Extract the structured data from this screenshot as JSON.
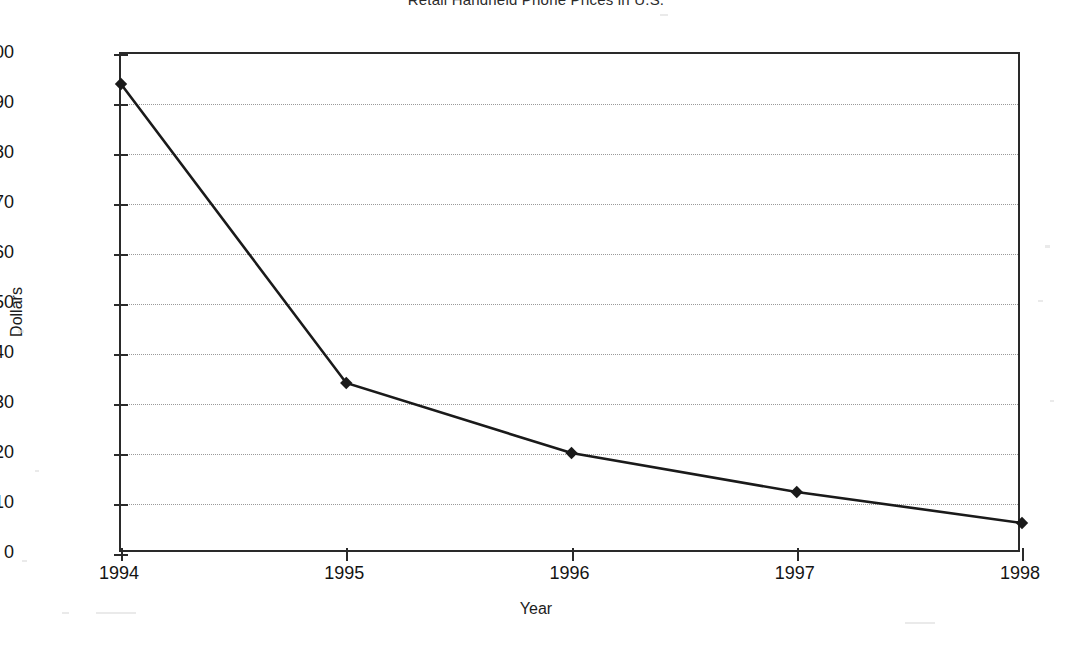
{
  "chart_data": {
    "type": "line",
    "title": "Retail Handheld Phone Prices in U.S.",
    "xlabel": "Year",
    "ylabel": "Dollars",
    "categories": [
      "1994",
      "1995",
      "1996",
      "1997",
      "1998"
    ],
    "values": [
      94,
      34.2,
      20.2,
      12.4,
      6.2
    ],
    "series": [
      {
        "name": "Retail handheld phone price",
        "values": [
          94,
          34.2,
          20.2,
          12.4,
          6.2
        ]
      }
    ],
    "xlim": [
      "1994",
      "1998"
    ],
    "ylim": [
      0,
      100
    ],
    "ytick_labels": [
      "100",
      "90",
      "80",
      "70",
      "60",
      "50",
      "40",
      "30",
      "20",
      "10",
      "0"
    ],
    "ytick_values": [
      100,
      90,
      80,
      70,
      60,
      50,
      40,
      30,
      20,
      10,
      0
    ],
    "xtick_labels": [
      "1994",
      "1995",
      "1996",
      "1997",
      "1998"
    ],
    "grid": true,
    "grid_style": "dotted",
    "grid_axis": "y",
    "legend": false,
    "legend_position": "none",
    "marker": "diamond",
    "line_color": "#1a1a1a",
    "marker_color": "#1a1a1a",
    "grid_color": "#9a9a9a",
    "axis_color": "#2a2a2a",
    "background_color": "#ffffff"
  }
}
